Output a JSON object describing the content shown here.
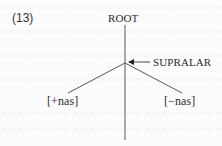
{
  "example": {
    "number": "(13)"
  },
  "tree": {
    "root_label": "ROOT",
    "intermediate_label": "SUPRALAR",
    "left_leaf": "[+nas]",
    "right_leaf": "[−nas]",
    "pointer": "arrow-left-icon"
  },
  "colors": {
    "ink": "#2a2a2a",
    "background": "#fcfcfc"
  }
}
